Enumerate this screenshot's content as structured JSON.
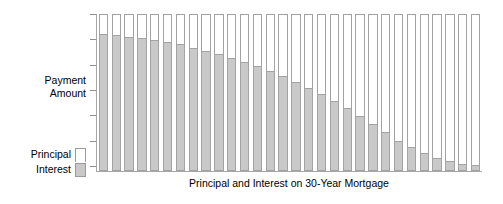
{
  "chart_data": {
    "type": "bar",
    "subtype": "stacked-bar",
    "title": "",
    "xlabel": "Principal and Interest on 30-Year Mortgage",
    "ylabel": "Payment\nAmount",
    "grid": false,
    "legend_position": "left",
    "y_tick_labels": [],
    "y_tick_count": 7,
    "ylim": [
      0,
      100
    ],
    "total_bar_value": 100,
    "categories": [
      1,
      2,
      3,
      4,
      5,
      6,
      7,
      8,
      9,
      10,
      11,
      12,
      13,
      14,
      15,
      16,
      17,
      18,
      19,
      20,
      21,
      22,
      23,
      24,
      25,
      26,
      27,
      28,
      29,
      30
    ],
    "series": [
      {
        "name": "Interest",
        "color": "#c9c9c9",
        "values": [
          88,
          87,
          86,
          85,
          84,
          82.5,
          81,
          79,
          77,
          75,
          72.5,
          70,
          67,
          64,
          60.5,
          57,
          53,
          49,
          44.5,
          40,
          35,
          30,
          24.5,
          19,
          15,
          11,
          8,
          5.5,
          4,
          3
        ]
      },
      {
        "name": "Principal",
        "color": "#ffffff",
        "values": [
          12,
          13,
          14,
          15,
          16,
          17.5,
          19,
          21,
          23,
          25,
          27.5,
          30,
          33,
          36,
          39.5,
          43,
          47,
          51,
          55.5,
          60,
          65,
          70,
          75.5,
          81,
          85,
          89,
          92,
          94.5,
          96,
          97
        ]
      }
    ]
  },
  "axes": {
    "y_label": "Payment\nAmount",
    "x_title": "Principal and Interest on 30-Year Mortgage"
  },
  "legend": {
    "entries": [
      {
        "label": "Principal",
        "swatch": "principal"
      },
      {
        "label": "Interest",
        "swatch": "interest"
      }
    ]
  },
  "colors": {
    "interest": "#c9c9c9",
    "principal": "#ffffff",
    "axis": "#a6a6a6",
    "bar_border": "#a3a3a3",
    "text": "#000000",
    "background": "#ffffff"
  }
}
